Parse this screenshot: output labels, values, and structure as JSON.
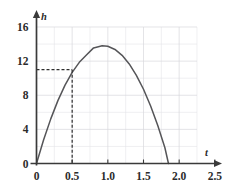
{
  "chart_data": {
    "type": "line",
    "title": "",
    "xlabel": "t",
    "ylabel": "h",
    "xlim": [
      0,
      2.5
    ],
    "ylim": [
      0,
      16
    ],
    "grid": true,
    "legend": null,
    "x_ticks": [
      "0",
      "0.5",
      "1.0",
      "1.5",
      "2.0",
      "2.5"
    ],
    "x_tick_values": [
      0,
      0.5,
      1.0,
      1.5,
      2.0,
      2.5
    ],
    "y_ticks": [
      "0",
      "4",
      "8",
      "12",
      "16"
    ],
    "y_tick_values": [
      0,
      4,
      8,
      12,
      16
    ],
    "x_minor_step": 0.25,
    "y_minor_step": 2,
    "grid_x_extent": [
      0,
      2.25
    ],
    "grid_y_extent": [
      0,
      16
    ],
    "series": [
      {
        "name": "h(t)",
        "description": "downward parabola through origin",
        "curve_type": "parabola",
        "vertex": {
          "t": 0.92,
          "h": 13.8
        },
        "roots": [
          0,
          1.85
        ],
        "points": [
          {
            "t": 0.0,
            "h": 0.0
          },
          {
            "t": 0.1,
            "h": 2.78
          },
          {
            "t": 0.2,
            "h": 5.23
          },
          {
            "t": 0.3,
            "h": 7.37
          },
          {
            "t": 0.4,
            "h": 9.19
          },
          {
            "t": 0.5,
            "h": 10.68
          },
          {
            "t": 0.6,
            "h": 11.86
          },
          {
            "t": 0.7,
            "h": 12.71
          },
          {
            "t": 0.8,
            "h": 13.55
          },
          {
            "t": 0.92,
            "h": 13.8
          },
          {
            "t": 1.0,
            "h": 13.74
          },
          {
            "t": 1.1,
            "h": 13.37
          },
          {
            "t": 1.2,
            "h": 12.68
          },
          {
            "t": 1.3,
            "h": 11.67
          },
          {
            "t": 1.4,
            "h": 10.34
          },
          {
            "t": 1.5,
            "h": 8.7
          },
          {
            "t": 1.6,
            "h": 6.73
          },
          {
            "t": 1.7,
            "h": 4.45
          },
          {
            "t": 1.8,
            "h": 1.85
          },
          {
            "t": 1.85,
            "h": 0.0
          }
        ]
      }
    ],
    "annotations": [
      {
        "type": "dashed-guide",
        "label": "reference lines to point",
        "point": {
          "t": 0.5,
          "h": 11
        },
        "horizontal_from_axis": true,
        "vertical_to_axis": true
      }
    ]
  },
  "axis": {
    "x_name": "t",
    "y_name": "h"
  },
  "colors": {
    "curve": "#555558",
    "axis": "#3a3a3a",
    "grid_major": "#d8d8dc",
    "grid_minor": "#e6e6ea",
    "guide": "#2e2e2e",
    "text": "#2b2b2b",
    "background": "#ffffff"
  }
}
